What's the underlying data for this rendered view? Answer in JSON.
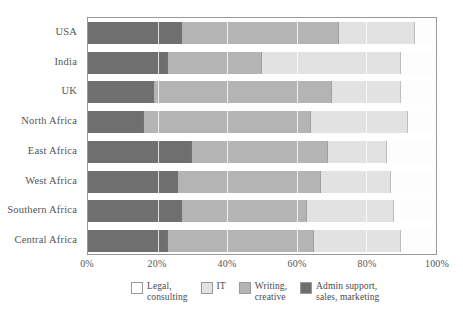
{
  "chart_data": {
    "type": "bar",
    "orientation": "horizontal",
    "stacked": true,
    "normalized": true,
    "title": "",
    "subtitle": "",
    "xlabel": "",
    "ylabel": "",
    "xlim": [
      0,
      100
    ],
    "xticks": [
      0,
      20,
      40,
      60,
      80,
      100
    ],
    "xticklabels": [
      "0%",
      "20%",
      "40%",
      "60%",
      "80%",
      "100%"
    ],
    "grid": true,
    "grid_axis": "x",
    "legend_position": "bottom",
    "categories": [
      "USA",
      "India",
      "UK",
      "North Africa",
      "East Africa",
      "West Africa",
      "Southern Africa",
      "Central Africa"
    ],
    "series": [
      {
        "name": "Admin support, sales, marketing",
        "color": "#6f6f6f",
        "values": [
          27,
          23,
          19,
          16,
          30,
          26,
          27,
          23
        ]
      },
      {
        "name": "Writing, creative",
        "color": "#b4b4b4",
        "values": [
          45,
          27,
          51,
          48,
          39,
          41,
          36,
          42
        ]
      },
      {
        "name": "IT",
        "color": "#e2e2e2",
        "values": [
          22,
          40,
          20,
          28,
          17,
          20,
          25,
          25
        ]
      },
      {
        "name": "Legal, consulting",
        "color": "#fdfdfd",
        "values": [
          6,
          10,
          10,
          8,
          14,
          13,
          12,
          10
        ]
      }
    ]
  },
  "legend": {
    "items": [
      {
        "label": "Legal,\nconsulting",
        "swatch_class": "sw-legal",
        "name": "legal-consulting"
      },
      {
        "label": "IT",
        "swatch_class": "sw-it",
        "name": "it"
      },
      {
        "label": "Writing,\ncreative",
        "swatch_class": "sw-writing",
        "name": "writing-creative"
      },
      {
        "label": "Admin support,\nsales, marketing",
        "swatch_class": "sw-admin",
        "name": "admin-support-sales-marketing"
      }
    ]
  },
  "colors": {
    "admin": "#6f6f6f",
    "writing": "#b4b4b4",
    "it": "#e2e2e2",
    "legal": "#fdfdfd",
    "axis": "#9a9a9a",
    "text": "#4a4a4a"
  }
}
